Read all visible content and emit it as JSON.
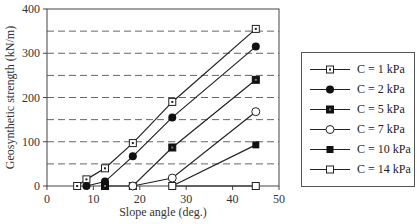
{
  "chart_data": {
    "type": "line",
    "title": "",
    "xlabel": "Slope angle (deg.)",
    "ylabel": "Geosynthetic strength (kN/m)",
    "xlim": [
      0,
      50
    ],
    "ylim": [
      0,
      400
    ],
    "xticks": [
      0,
      10,
      20,
      30,
      40,
      50
    ],
    "yticks": [
      0,
      100,
      200,
      300,
      400
    ],
    "grid": {
      "y_dashed_every": 50
    },
    "legend_position": "right",
    "series": [
      {
        "name": "C = 1 kPa",
        "marker": "square-dot",
        "x": [
          6.5,
          8.5,
          12.5,
          18.5,
          27,
          45
        ],
        "y": [
          0,
          15,
          40,
          97,
          190,
          355
        ]
      },
      {
        "name": "C = 2 kPa",
        "marker": "filled-circle",
        "x": [
          8.5,
          12.5,
          18.5,
          27,
          45
        ],
        "y": [
          0,
          10,
          67,
          155,
          315
        ]
      },
      {
        "name": "C = 5 kPa",
        "marker": "square-filled-dot",
        "x": [
          12.5,
          18.5,
          27,
          45
        ],
        "y": [
          0,
          0,
          87,
          240
        ]
      },
      {
        "name": "C = 7 kPa",
        "marker": "open-circle",
        "x": [
          18.5,
          27,
          45
        ],
        "y": [
          0,
          18,
          168
        ]
      },
      {
        "name": "C = 10 kPa",
        "marker": "filled-square",
        "x": [
          27,
          45
        ],
        "y": [
          0,
          93
        ]
      },
      {
        "name": "C = 14 kPa",
        "marker": "open-square",
        "x": [
          27,
          45
        ],
        "y": [
          0,
          0
        ]
      }
    ]
  }
}
